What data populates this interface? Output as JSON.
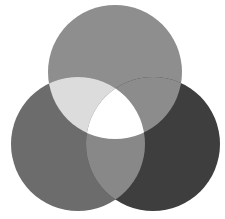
{
  "diagram": {
    "type": "venn-3",
    "width": 225,
    "height": 219,
    "background": "#ffffff",
    "circles": [
      {
        "id": "top",
        "cx": 115,
        "cy": 72,
        "r": 67,
        "color": "#8e8e8e"
      },
      {
        "id": "left",
        "cx": 78,
        "cy": 144,
        "r": 67,
        "color": "#6c6c6c"
      },
      {
        "id": "right",
        "cx": 153,
        "cy": 144,
        "r": 67,
        "color": "#3e3e3e"
      }
    ],
    "intersections": {
      "top_left": "#dcdcdc",
      "top_right": "#8c8c8c",
      "left_right": "#888888",
      "all": "#ffffff"
    }
  }
}
